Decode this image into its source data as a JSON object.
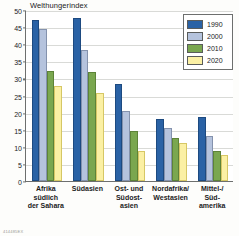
{
  "chart_data": {
    "type": "bar",
    "title": "Welthungerindex",
    "xlabel": "",
    "ylabel": "",
    "ylim": [
      0,
      50
    ],
    "yticks": [
      0,
      5,
      10,
      15,
      20,
      25,
      30,
      35,
      40,
      45,
      50
    ],
    "grid": true,
    "legend_position": "top-right",
    "categories": [
      "Afrika\nsüdlich\nder Sahara",
      "Südasien",
      "Ost- und\nSüdost-\nasien",
      "Nordafrika/\nWestasien",
      "Mittel-/\nSüd-\namerika"
    ],
    "category_lines": [
      [
        "Afrika",
        "südlich",
        "der Sahara"
      ],
      [
        "Südasien"
      ],
      [
        "Ost- und",
        "Südost-",
        "asien"
      ],
      [
        "Nordafrika/",
        "Westasien"
      ],
      [
        "Mittel-/",
        "Süd-",
        "amerika"
      ]
    ],
    "series": [
      {
        "name": "1990",
        "color": "#2a62a5",
        "values": [
          47.2,
          47.6,
          28.4,
          18.1,
          18.7
        ]
      },
      {
        "name": "2000",
        "color": "#b5c3dd",
        "values": [
          44.4,
          38.2,
          20.6,
          15.5,
          13.3
        ]
      },
      {
        "name": "2010",
        "color": "#7aa74f",
        "values": [
          32.2,
          31.9,
          14.7,
          12.6,
          8.8
        ]
      },
      {
        "name": "2020",
        "color": "#fbf0a4",
        "values": [
          27.7,
          25.8,
          8.7,
          11.2,
          7.6
        ]
      }
    ]
  },
  "source_code": "414485EX"
}
